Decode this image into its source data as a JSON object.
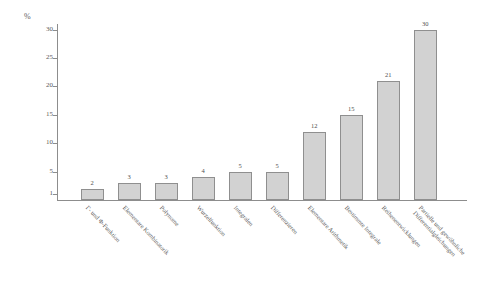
{
  "chart_data": {
    "type": "bar",
    "title": "",
    "subtitle": "",
    "xlabel": "",
    "ylabel": "%",
    "ylim": [
      0,
      31
    ],
    "grid": false,
    "legend": null,
    "orientation": "vertical",
    "value_labels_shown": true,
    "y_ticks": [
      "1",
      "5",
      "10",
      "15",
      "20",
      "25",
      "30"
    ],
    "y_tick_values": [
      1,
      5,
      10,
      15,
      20,
      25,
      30
    ],
    "categories": [
      "Γ- und Φ-Funktion",
      "Elementare Kombinatorik",
      "Polynome",
      "Wurzelfunktion",
      "Integralen",
      "Differenzieren",
      "Elementare Arithmetik",
      "Bestimmte Integrale",
      "Reihenentwicklungen",
      "Partielle und gewöhnliche Differentialgleichungen"
    ],
    "category_lines": [
      [
        "Γ- und Φ-Funktion"
      ],
      [
        "Elementare Kombinatorik"
      ],
      [
        "Polynome"
      ],
      [
        "Wurzelfunktion"
      ],
      [
        "Integralen"
      ],
      [
        "Differenzieren"
      ],
      [
        "Elementare Arithmetik"
      ],
      [
        "Bestimmte Integrale"
      ],
      [
        "Reihenentwicklungen"
      ],
      [
        "Partielle und gewöhnliche",
        "Differentialgleichungen"
      ]
    ],
    "values": [
      2,
      3,
      3,
      4,
      5,
      5,
      12,
      15,
      21,
      30
    ],
    "value_labels": [
      "2",
      "3",
      "3",
      "4",
      "5",
      "5",
      "12",
      "15",
      "21",
      "30"
    ],
    "colors": {
      "bar_fill": "#d2d2d2",
      "bar_stroke": "#8f8f8f",
      "axis": "#8d8d8d",
      "text": "#555555",
      "background": "#ffffff"
    }
  }
}
